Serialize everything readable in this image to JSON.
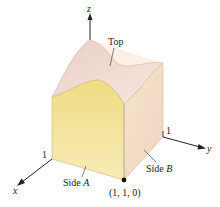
{
  "figure": {
    "axes": {
      "x_label": "x",
      "y_label": "y",
      "z_label": "z",
      "x_tick": "1",
      "y_tick": "1"
    },
    "labels": {
      "top": "Top",
      "side_a_word": "Side ",
      "side_a_letter": "A",
      "side_b_word": "Side ",
      "side_b_letter": "B",
      "corner_point": "(1, 1, 0)"
    },
    "colors": {
      "side_a_fill": "#f3e39a",
      "side_b_fill": "#f3dcc8",
      "top_fill": "#f1ddd3",
      "floor_fill": "#faf0c8",
      "edge": "#d8b8a8",
      "axis": "#222222",
      "point": "#111111"
    }
  }
}
